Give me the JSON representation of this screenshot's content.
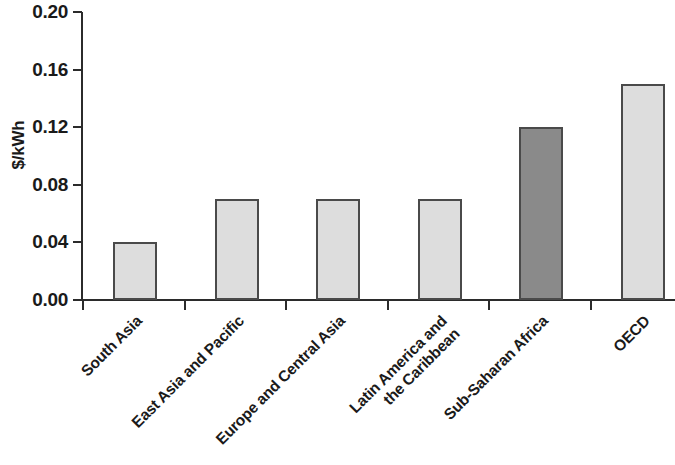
{
  "chart_data": {
    "type": "bar",
    "title": "",
    "xlabel": "",
    "ylabel": "$/kWh",
    "ylim": [
      0.0,
      0.2
    ],
    "ytick_labels": [
      "0.00",
      "0.04",
      "0.08",
      "0.12",
      "0.16",
      "0.20"
    ],
    "ytick_values": [
      0.0,
      0.04,
      0.08,
      0.12,
      0.16,
      0.2
    ],
    "grid": false,
    "legend": "none",
    "categories": [
      "South Asia",
      "East Asia and Pacific",
      "Europe and Central Asia",
      "Latin America and\nthe Caribbean",
      "Sub-Saharan Africa",
      "OECD"
    ],
    "values": [
      0.04,
      0.07,
      0.07,
      0.07,
      0.12,
      0.15
    ],
    "bar_colors": [
      "#dddddd",
      "#dddddd",
      "#dddddd",
      "#dddddd",
      "#8a8a8a",
      "#dddddd"
    ],
    "bar_edge_color": "#4a4a4a",
    "highlight_category": "Sub-Saharan Africa",
    "axis_color": "#2b2b2b"
  }
}
